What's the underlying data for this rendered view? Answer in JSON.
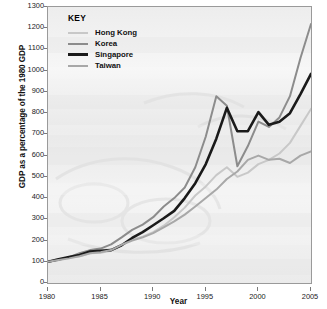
{
  "chart_data": {
    "type": "line",
    "title": "",
    "xlabel": "Year",
    "ylabel": "GDP as a percentage of the 1980 GDP",
    "xlim": [
      1980,
      2005
    ],
    "ylim": [
      0,
      1300
    ],
    "ytick_step": 100,
    "xtick_step": 5,
    "grid": false,
    "legend_position": "top-left-inside",
    "legend_title": "KEY",
    "x": [
      1980,
      1981,
      1982,
      1983,
      1984,
      1985,
      1986,
      1987,
      1988,
      1989,
      1990,
      1991,
      1992,
      1993,
      1994,
      1995,
      1996,
      1997,
      1998,
      1999,
      2000,
      2001,
      2002,
      2003,
      2004,
      2005
    ],
    "yticks": [
      0,
      100,
      200,
      300,
      400,
      500,
      600,
      700,
      800,
      900,
      1000,
      1100,
      1200,
      1300
    ],
    "xticks": [
      1980,
      1985,
      1990,
      1995,
      2000,
      2005
    ],
    "series": [
      {
        "name": "Hong Kong",
        "color": "#c8c8c8",
        "width": 2.0,
        "values": [
          100,
          112,
          120,
          126,
          140,
          142,
          152,
          178,
          205,
          218,
          240,
          270,
          310,
          355,
          412,
          455,
          508,
          545,
          500,
          520,
          560,
          580,
          610,
          660,
          740,
          820
        ]
      },
      {
        "name": "Korea",
        "color": "#8c8c8c",
        "width": 2.0,
        "values": [
          100,
          108,
          122,
          140,
          155,
          162,
          182,
          215,
          250,
          275,
          310,
          360,
          400,
          450,
          545,
          690,
          880,
          835,
          550,
          645,
          760,
          735,
          780,
          880,
          1060,
          1220
        ]
      },
      {
        "name": "Singapore",
        "color": "#1a1a1a",
        "width": 2.6,
        "values": [
          100,
          112,
          122,
          132,
          148,
          152,
          155,
          178,
          212,
          240,
          272,
          305,
          340,
          400,
          470,
          560,
          680,
          825,
          715,
          715,
          805,
          745,
          760,
          800,
          890,
          985
        ]
      },
      {
        "name": "Taiwan",
        "color": "#a8a8a8",
        "width": 2.0,
        "values": [
          100,
          108,
          116,
          126,
          140,
          145,
          155,
          180,
          200,
          215,
          235,
          262,
          290,
          322,
          360,
          400,
          440,
          490,
          525,
          580,
          600,
          580,
          585,
          565,
          600,
          620
        ]
      }
    ]
  },
  "axes": {
    "ylabel": "GDP as a percentage of the 1980 GDP",
    "xlabel": "Year"
  },
  "legend": {
    "title": "KEY",
    "items": [
      {
        "label": "Hong Kong",
        "color": "#c8c8c8"
      },
      {
        "label": "Korea",
        "color": "#8c8c8c"
      },
      {
        "label": "Singapore",
        "color": "#1a1a1a"
      },
      {
        "label": "Taiwan",
        "color": "#a8a8a8"
      }
    ]
  }
}
